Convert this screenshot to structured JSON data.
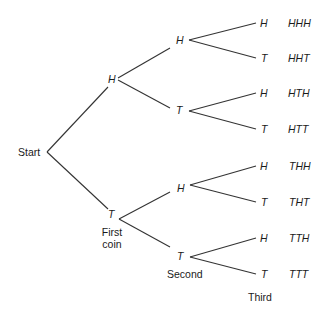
{
  "diagram": {
    "type": "probability-tree",
    "root": "Start",
    "levels": [
      "First coin",
      "Second",
      "Third"
    ],
    "level1": [
      "H",
      "T"
    ],
    "level2": [
      "H",
      "T",
      "H",
      "T"
    ],
    "level3": [
      "H",
      "T",
      "H",
      "T",
      "H",
      "T",
      "H",
      "T"
    ],
    "outcomes": [
      "HHH",
      "HHT",
      "HTH",
      "HTT",
      "THH",
      "THT",
      "TTH",
      "TTT"
    ],
    "line_color": "#333333",
    "text_color": "#1a1a1a"
  }
}
